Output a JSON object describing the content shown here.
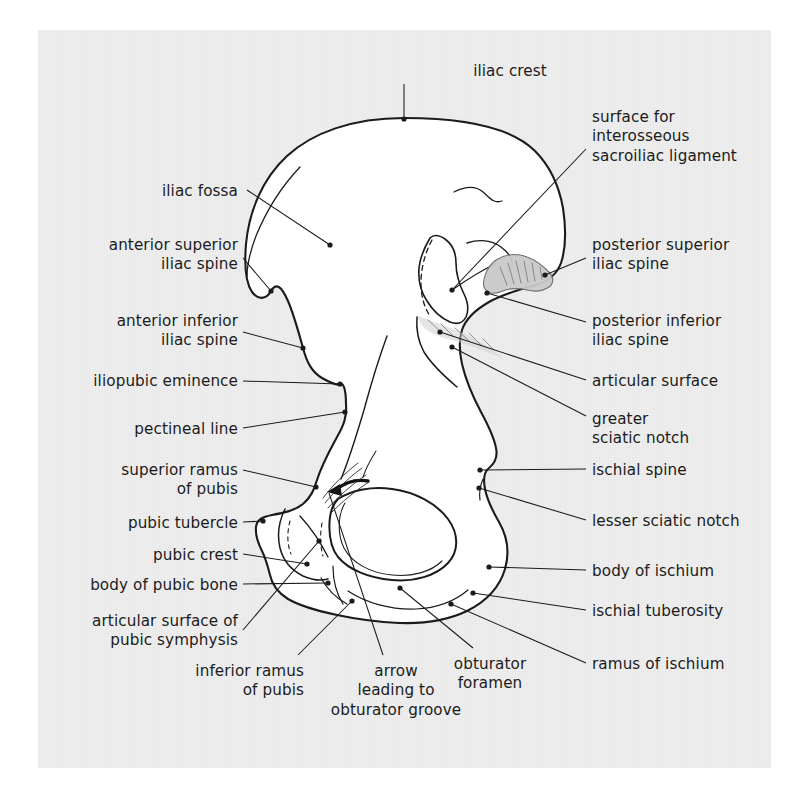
{
  "figure": {
    "kind": "anatomical-line-drawing",
    "background_color": "#eeeeee",
    "page_color": "#ffffff",
    "ink_color": "#1b1b1b",
    "bone_fill": "#ffffff",
    "shaded_fill": "#c9c9c9"
  },
  "labels": [
    {
      "id": "iliac-crest",
      "text": "iliac crest",
      "align": "center",
      "x": 430,
      "y": 62,
      "w": 160
    },
    {
      "id": "surface-interosseous",
      "text": "surface for\ninterosseous\nsacroiliac ligament",
      "align": "left",
      "x": 592,
      "y": 108,
      "w": 200
    },
    {
      "id": "iliac-fossa",
      "text": "iliac fossa",
      "align": "right",
      "x": 20,
      "y": 182,
      "w": 218
    },
    {
      "id": "posterior-superior-iliac-spine",
      "text": "posterior superior\niliac spine",
      "align": "left",
      "x": 592,
      "y": 236,
      "w": 200
    },
    {
      "id": "anterior-superior-iliac-spine",
      "text": "anterior superior\niliac spine",
      "align": "right",
      "x": 20,
      "y": 236,
      "w": 218
    },
    {
      "id": "posterior-inferior-iliac-spine",
      "text": "posterior inferior\niliac spine",
      "align": "left",
      "x": 592,
      "y": 312,
      "w": 200
    },
    {
      "id": "anterior-inferior-iliac-spine",
      "text": "anterior inferior\niliac spine",
      "align": "right",
      "x": 20,
      "y": 312,
      "w": 218
    },
    {
      "id": "articular-surface",
      "text": "articular surface",
      "align": "left",
      "x": 592,
      "y": 372,
      "w": 200
    },
    {
      "id": "iliopubic-eminence",
      "text": "iliopubic eminence",
      "align": "right",
      "x": 20,
      "y": 372,
      "w": 218
    },
    {
      "id": "greater-sciatic-notch",
      "text": "greater\nsciatic notch",
      "align": "left",
      "x": 592,
      "y": 410,
      "w": 200
    },
    {
      "id": "pectineal-line",
      "text": "pectineal line",
      "align": "right",
      "x": 20,
      "y": 420,
      "w": 218
    },
    {
      "id": "ischial-spine",
      "text": "ischial spine",
      "align": "left",
      "x": 592,
      "y": 461,
      "w": 200
    },
    {
      "id": "superior-ramus-of-pubis",
      "text": "superior ramus\nof pubis",
      "align": "right",
      "x": 20,
      "y": 461,
      "w": 218
    },
    {
      "id": "lesser-sciatic-notch",
      "text": "lesser sciatic notch",
      "align": "left",
      "x": 592,
      "y": 512,
      "w": 200
    },
    {
      "id": "pubic-tubercle",
      "text": "pubic tubercle",
      "align": "right",
      "x": 20,
      "y": 514,
      "w": 218
    },
    {
      "id": "body-of-ischium",
      "text": "body of ischium",
      "align": "left",
      "x": 592,
      "y": 562,
      "w": 200
    },
    {
      "id": "pubic-crest",
      "text": "pubic crest",
      "align": "right",
      "x": 20,
      "y": 546,
      "w": 218
    },
    {
      "id": "body-of-pubic-bone",
      "text": "body of pubic bone",
      "align": "right",
      "x": 20,
      "y": 576,
      "w": 218
    },
    {
      "id": "ischial-tuberosity",
      "text": "ischial tuberosity",
      "align": "left",
      "x": 592,
      "y": 602,
      "w": 200
    },
    {
      "id": "articular-surface-pubic-symphysis",
      "text": "articular surface of\npubic symphysis",
      "align": "right",
      "x": 20,
      "y": 612,
      "w": 218
    },
    {
      "id": "ramus-of-ischium",
      "text": "ramus of ischium",
      "align": "left",
      "x": 592,
      "y": 655,
      "w": 200
    },
    {
      "id": "inferior-ramus-of-pubis",
      "text": "inferior ramus\nof pubis",
      "align": "right",
      "x": 110,
      "y": 662,
      "w": 194
    },
    {
      "id": "arrow-obturator-groove",
      "text": "arrow\nleading to\nobturator groove",
      "align": "center",
      "x": 322,
      "y": 662,
      "w": 148
    },
    {
      "id": "obturator-foramen",
      "text": "obturator\nforamen",
      "align": "center",
      "x": 430,
      "y": 655,
      "w": 120
    }
  ],
  "leaders": [
    {
      "id": "leader-iliac-crest",
      "d": "M404,84 L404,118"
    },
    {
      "id": "leader-surface-interosseous",
      "d": "M586,149 L452,290"
    },
    {
      "id": "leader-iliac-fossa",
      "d": "M247,190 L330,245"
    },
    {
      "id": "leader-posterior-superior-iliac-spine",
      "d": "M586,258 L545,275"
    },
    {
      "id": "leader-anterior-superior-iliac-spine",
      "d": "M243,258 L271,291"
    },
    {
      "id": "leader-posterior-inferior-iliac-spine",
      "d": "M586,322 L487,293"
    },
    {
      "id": "leader-anterior-inferior-iliac-spine",
      "d": "M243,332 L303,348"
    },
    {
      "id": "leader-articular-surface",
      "d": "M586,380 L440,332"
    },
    {
      "id": "leader-iliopubic-eminence",
      "d": "M243,381 L340,384"
    },
    {
      "id": "leader-greater-sciatic-notch",
      "d": "M586,416 L452,347"
    },
    {
      "id": "leader-pectineal-line",
      "d": "M243,428 L345,412"
    },
    {
      "id": "leader-ischial-spine",
      "d": "M586,469 L480,470"
    },
    {
      "id": "leader-superior-ramus-of-pubis",
      "d": "M243,470 L316,487"
    },
    {
      "id": "leader-lesser-sciatic-notch",
      "d": "M586,520 L479,488"
    },
    {
      "id": "leader-pubic-tubercle",
      "d": "M243,522 L263,521"
    },
    {
      "id": "leader-body-of-ischium",
      "d": "M586,570 L489,567"
    },
    {
      "id": "leader-pubic-crest",
      "d": "M243,554 L307,564"
    },
    {
      "id": "leader-body-of-pubic-bone",
      "d": "M243,584 L328,583"
    },
    {
      "id": "leader-ischial-tuberosity",
      "d": "M586,610 L473,593"
    },
    {
      "id": "leader-articular-surface-pubic-symphysis",
      "d": "M243,630 L319,541"
    },
    {
      "id": "leader-ramus-of-ischium",
      "d": "M586,663 L451,604"
    },
    {
      "id": "leader-inferior-ramus-of-pubis",
      "d": "M298,655 L352,601"
    },
    {
      "id": "leader-arrow-obturator-groove",
      "d": "M383,655 L329,493"
    },
    {
      "id": "leader-obturator-foramen",
      "d": "M473,648 L400,588"
    }
  ],
  "dots": [
    {
      "id": "dot-iliac-crest",
      "x": 404,
      "y": 119
    },
    {
      "id": "dot-iliac-fossa",
      "x": 330,
      "y": 245
    },
    {
      "id": "dot-anterior-superior-iliac-spine",
      "x": 271,
      "y": 291
    },
    {
      "id": "dot-surface-interosseous",
      "x": 452,
      "y": 290
    },
    {
      "id": "dot-posterior-superior-iliac-spine",
      "x": 545,
      "y": 275
    },
    {
      "id": "dot-posterior-inferior-iliac-spine",
      "x": 487,
      "y": 293
    },
    {
      "id": "dot-articular-surface",
      "x": 440,
      "y": 332
    },
    {
      "id": "dot-greater-sciatic-notch",
      "x": 452,
      "y": 347
    },
    {
      "id": "dot-anterior-inferior-iliac-spine",
      "x": 303,
      "y": 348
    },
    {
      "id": "dot-iliopubic-eminence",
      "x": 340,
      "y": 384
    },
    {
      "id": "dot-pectineal-line",
      "x": 345,
      "y": 412
    },
    {
      "id": "dot-ischial-spine",
      "x": 480,
      "y": 470
    },
    {
      "id": "dot-superior-ramus-of-pubis",
      "x": 316,
      "y": 487
    },
    {
      "id": "dot-lesser-sciatic-notch",
      "x": 479,
      "y": 488
    },
    {
      "id": "dot-pubic-tubercle",
      "x": 263,
      "y": 521
    },
    {
      "id": "dot-pubic-crest",
      "x": 307,
      "y": 564
    },
    {
      "id": "dot-body-of-ischium",
      "x": 489,
      "y": 567
    },
    {
      "id": "dot-articular-surface-pubic-symphysis",
      "x": 319,
      "y": 541
    },
    {
      "id": "dot-body-of-pubic-bone",
      "x": 328,
      "y": 583
    },
    {
      "id": "dot-ischial-tuberosity",
      "x": 473,
      "y": 593
    },
    {
      "id": "dot-obturator-foramen",
      "x": 400,
      "y": 588
    },
    {
      "id": "dot-inferior-ramus-of-pubis",
      "x": 352,
      "y": 601
    },
    {
      "id": "dot-ramus-of-ischium",
      "x": 451,
      "y": 604
    }
  ]
}
